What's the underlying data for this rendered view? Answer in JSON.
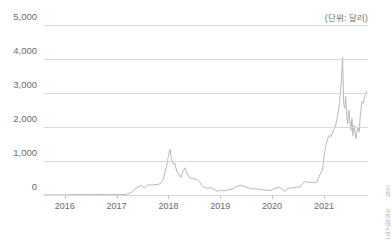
{
  "unit_note": "(단위: 달러)",
  "source_credit": "출처: 코인데스크",
  "chart_data": {
    "type": "line",
    "title": "",
    "subtitle": "",
    "xlabel": "",
    "ylabel": "",
    "unit_note": "(단위: 달러)",
    "grid": true,
    "legend": false,
    "legend_position": "none",
    "line_color": "#b9b9b9",
    "grid_color": "#d8d8d8",
    "axis_text_color": "#6a6a6a",
    "xlim": [
      2015.6,
      2021.85
    ],
    "ylim": [
      0,
      5000
    ],
    "ytick_labels": [
      "5,000",
      "4,000",
      "3,000",
      "2,000",
      "1,000",
      "0"
    ],
    "yticks": [
      5000,
      4000,
      3000,
      2000,
      1000,
      0
    ],
    "xtick_labels": [
      "2016",
      "2017",
      "2018",
      "2019",
      "2020",
      "2021"
    ],
    "xticks": [
      2016,
      2017,
      2018,
      2019,
      2020,
      2021
    ],
    "series": [
      {
        "name": "price",
        "x": [
          2015.6,
          2015.7,
          2015.8,
          2015.9,
          2016.0,
          2016.1,
          2016.2,
          2016.3,
          2016.4,
          2016.5,
          2016.6,
          2016.7,
          2016.8,
          2016.9,
          2017.0,
          2017.06,
          2017.12,
          2017.18,
          2017.24,
          2017.3,
          2017.36,
          2017.42,
          2017.48,
          2017.54,
          2017.6,
          2017.66,
          2017.72,
          2017.78,
          2017.84,
          2017.9,
          2017.94,
          2017.97,
          2018.0,
          2018.03,
          2018.06,
          2018.09,
          2018.12,
          2018.16,
          2018.2,
          2018.24,
          2018.28,
          2018.32,
          2018.36,
          2018.4,
          2018.46,
          2018.52,
          2018.58,
          2018.64,
          2018.7,
          2018.76,
          2018.82,
          2018.88,
          2018.94,
          2019.0,
          2019.08,
          2019.16,
          2019.24,
          2019.32,
          2019.4,
          2019.48,
          2019.56,
          2019.64,
          2019.72,
          2019.8,
          2019.88,
          2019.96,
          2020.04,
          2020.12,
          2020.18,
          2020.24,
          2020.3,
          2020.38,
          2020.46,
          2020.54,
          2020.62,
          2020.7,
          2020.78,
          2020.86,
          2020.92,
          2020.97,
          2021.02,
          2021.06,
          2021.1,
          2021.14,
          2021.18,
          2021.22,
          2021.26,
          2021.3,
          2021.34,
          2021.36,
          2021.38,
          2021.4,
          2021.42,
          2021.44,
          2021.46,
          2021.48,
          2021.5,
          2021.52,
          2021.54,
          2021.56,
          2021.58,
          2021.6,
          2021.62,
          2021.64,
          2021.66,
          2021.68,
          2021.7,
          2021.72,
          2021.74,
          2021.76,
          2021.78,
          2021.8,
          2021.82
        ],
        "values": [
          1,
          1,
          1,
          1,
          1,
          8,
          11,
          13,
          12,
          12,
          11,
          12,
          12,
          11,
          10,
          11,
          13,
          20,
          50,
          95,
          190,
          230,
          280,
          200,
          300,
          290,
          300,
          310,
          330,
          450,
          700,
          880,
          1150,
          1350,
          1050,
          900,
          950,
          700,
          620,
          520,
          700,
          800,
          640,
          520,
          480,
          470,
          430,
          290,
          220,
          200,
          210,
          170,
          110,
          140,
          120,
          160,
          180,
          250,
          290,
          240,
          200,
          180,
          180,
          155,
          145,
          130,
          180,
          230,
          200,
          110,
          190,
          210,
          230,
          240,
          390,
          380,
          360,
          380,
          590,
          740,
          1320,
          1600,
          1750,
          1720,
          1900,
          2000,
          2300,
          2700,
          3450,
          4050,
          2700,
          2550,
          2900,
          2300,
          2100,
          2500,
          2200,
          1900,
          2250,
          1750,
          2050,
          1850,
          1650,
          1900,
          2000,
          1850,
          2300,
          2600,
          2750,
          2700,
          2850,
          2950,
          3050
        ]
      }
    ],
    "annotations": [
      {
        "text": "(단위: 달러)",
        "position": "top-right"
      }
    ]
  }
}
